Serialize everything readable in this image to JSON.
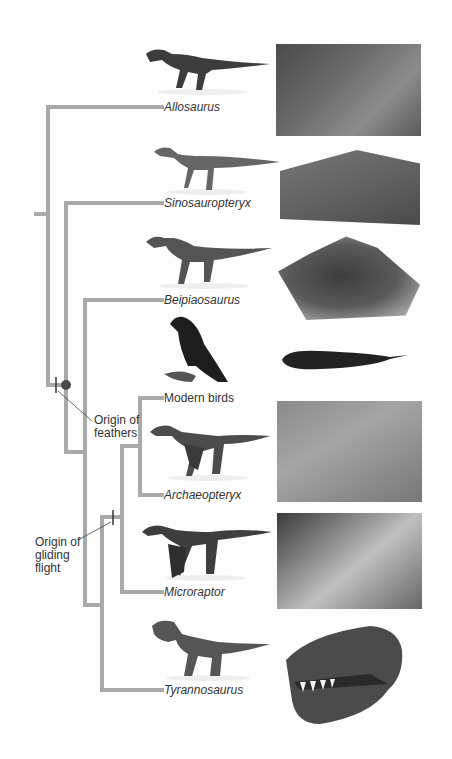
{
  "diagram": {
    "type": "cladogram",
    "line_color": "#a9a9a9",
    "taxa": [
      {
        "name": "Allosaurus",
        "italic": true,
        "y": 107
      },
      {
        "name": "Sinosauropteryx",
        "italic": true,
        "y": 203
      },
      {
        "name": "Beipiaosaurus",
        "italic": true,
        "y": 300
      },
      {
        "name": "Modern birds",
        "italic": false,
        "y": 398
      },
      {
        "name": "Archaeopteryx",
        "italic": true,
        "y": 495
      },
      {
        "name": "Microraptor",
        "italic": true,
        "y": 592
      },
      {
        "name": "Tyrannosaurus",
        "italic": true,
        "y": 690
      }
    ],
    "annotations": [
      {
        "id": "feathers",
        "line1": "Origin of",
        "line2": "feathers"
      },
      {
        "id": "gliding",
        "line1": "Origin of",
        "line2": "gliding",
        "line3": "flight"
      }
    ],
    "node_marker_color": "#4a4a4a"
  }
}
